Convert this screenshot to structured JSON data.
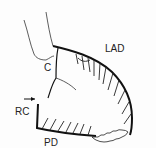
{
  "diagram": {
    "type": "coronary-artery-schematic",
    "labels": {
      "c": "C",
      "lad": "LAD",
      "rc": "RC",
      "pd": "PD"
    },
    "arrow": {
      "points_to": "RC",
      "glyph": "→"
    },
    "colors": {
      "line": "#1a1a1a",
      "background": "#fdfdfd"
    }
  }
}
